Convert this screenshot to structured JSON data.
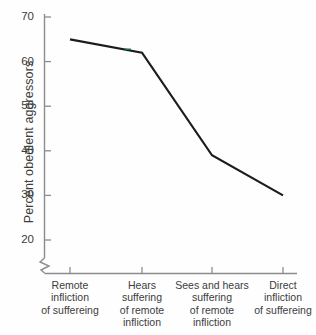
{
  "chart_data": {
    "type": "line",
    "title": "",
    "subtitle": "",
    "xlabel": "",
    "ylabel": "Percent obedient aggressors",
    "categories": [
      "Remote\ninfliction\nof suffereing",
      "Hears\nsuffering\nof remote\ninfliction",
      "Sees and hears\nsuffering\nof remote\ninfliction",
      "Direct\ninfliction\nof suffereing"
    ],
    "values": [
      65,
      62,
      39,
      30
    ],
    "series": [
      {
        "name": "Percent obedient aggressors",
        "values": [
          65,
          62,
          39,
          30
        ]
      }
    ],
    "ylim": [
      15,
      70
    ],
    "yticks": [
      20,
      30,
      40,
      50,
      60,
      70
    ],
    "ytick_labels": [
      "20",
      "30",
      "40",
      "50",
      "60",
      "70"
    ],
    "xticks": [
      1,
      2,
      3,
      4
    ],
    "grid": false,
    "legend": false,
    "legend_position": "none",
    "axis_break": true,
    "annotations": [],
    "line_color": "#1c1c1c",
    "axis_color": "#8c8c8c",
    "background_color": "#fefefe",
    "text_color": "#3c3c3c"
  },
  "axes": {
    "y_title": "Percent obedient aggressors",
    "y_tick_labels": [
      "70",
      "60",
      "50",
      "40",
      "30",
      "20"
    ],
    "x_tick_labels": [
      "Remote\ninfliction\nof suffereing",
      "Hears\nsuffering\nof remote\ninfliction",
      "Sees and hears\nsuffering\nof remote\ninfliction",
      "Direct\ninfliction\nof suffereing"
    ]
  }
}
